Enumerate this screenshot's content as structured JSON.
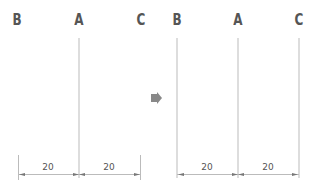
{
  "diagram": {
    "left_panel": {
      "labels": [
        "B",
        "A",
        "C"
      ],
      "dimensions": [
        "20",
        "20"
      ],
      "guides_shown": [
        "A"
      ]
    },
    "transition_arrow": "right-arrow-icon",
    "right_panel": {
      "labels": [
        "B",
        "A",
        "C"
      ],
      "dimensions": [
        "20",
        "20"
      ],
      "guides_shown": [
        "B",
        "A",
        "C"
      ]
    },
    "colors": {
      "line": "#bbbbbb",
      "text": "#555555",
      "arrow": "#888888"
    }
  }
}
